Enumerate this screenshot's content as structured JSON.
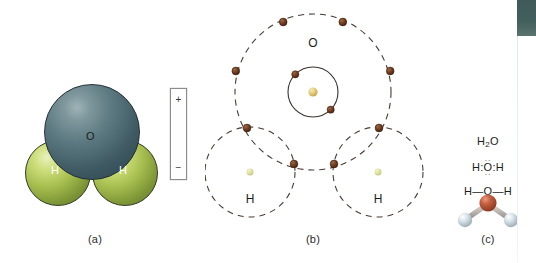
{
  "figure": {
    "background_color": "#ffffff"
  },
  "panel_a": {
    "caption": "(a)",
    "type": "space-filling-model",
    "oxygen_label": "O",
    "hydrogen_left_label": "H",
    "hydrogen_right_label": "H",
    "oxygen_color": "#4e6a73",
    "hydrogen_color": "#a8bf50"
  },
  "dipole": {
    "name": "polarity-indicator",
    "plus_label": "+",
    "minus_label": "−",
    "border_color": "#8c8c8c"
  },
  "panel_b": {
    "caption": "(b)",
    "type": "bohr-shell-diagram",
    "oxygen_label": "O",
    "hydrogen_left_label": "H",
    "hydrogen_right_label": "H",
    "electron_color": "#6b3a21",
    "nucleus_color": "#e8d27a",
    "hydrogen_nucleus_color": "#d6dc9a",
    "orbit_line_color": "#4a3a33",
    "shells": {
      "oxygen_inner_radius": 25,
      "oxygen_outer_radius": 78,
      "hydrogen_radius": 45,
      "oxygen_inner_electrons": 2,
      "oxygen_outer_electrons": 6,
      "bonding_electron_pairs": 2
    }
  },
  "panel_c": {
    "caption": "(c)",
    "molecular_formula": "H",
    "molecular_formula_sub": "2",
    "molecular_formula_tail": "O",
    "lewis_formula": "H:O:H",
    "lewis_left": "H:",
    "lewis_center": "O",
    "lewis_right": ":H",
    "lewis_dots_top": "··",
    "lewis_dots_bottom": "··",
    "structural_formula": "H—O—H",
    "ball_stick": {
      "oxygen_color": "#b04a32",
      "hydrogen_color": "#c9d6dc",
      "bond_color": "#b9b3ae"
    }
  },
  "edge_bar": {
    "name": "page-edge-bar",
    "color": "#44605d"
  }
}
